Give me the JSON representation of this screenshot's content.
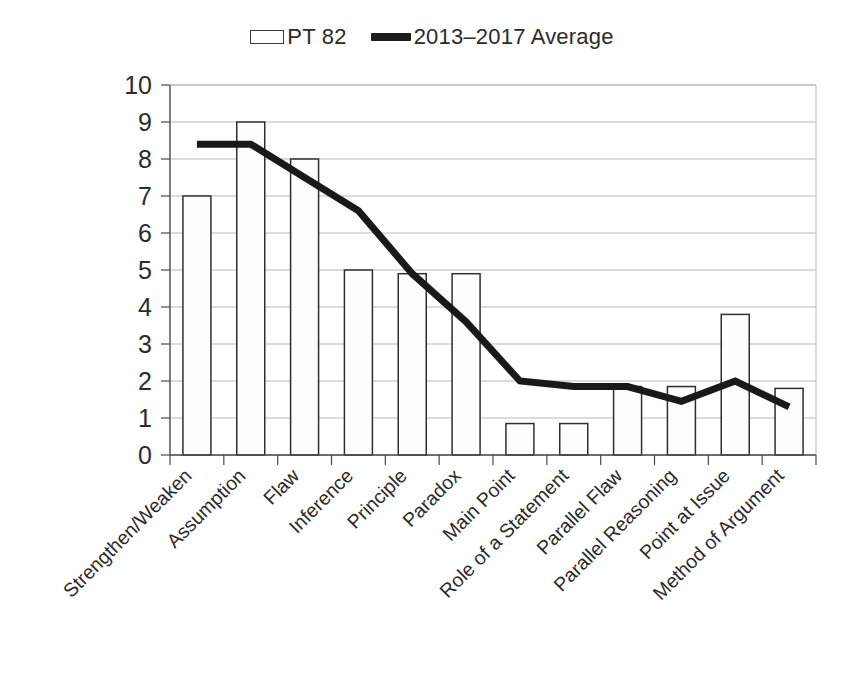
{
  "legend": {
    "position": "top-center",
    "entries": [
      {
        "label": "PT 82",
        "marker": "bar-swatch-icon",
        "type": "bar"
      },
      {
        "label": "2013–2017 Average",
        "marker": "line-swatch-icon",
        "type": "line"
      }
    ]
  },
  "colors": {
    "bar_fill": "#fdfdfd",
    "bar_stroke": "#2e2e2e",
    "line": "#191919",
    "gridline": "#b9b9b9",
    "axis": "#4a4a4a",
    "text": "#2b2b2b",
    "background": "#ffffff"
  },
  "chart_data": {
    "type": "bar",
    "title": "",
    "subtitle": "",
    "xlabel": "",
    "ylabel": "",
    "ylim": [
      0,
      10
    ],
    "yticks": [
      0,
      1,
      2,
      3,
      4,
      5,
      6,
      7,
      8,
      9,
      10
    ],
    "ytick_labels": [
      "0",
      "1",
      "2",
      "3",
      "4",
      "5",
      "6",
      "7",
      "8",
      "9",
      "10"
    ],
    "grid": true,
    "grid_axis": "y",
    "xtick_rotation": 45,
    "categories": [
      "Strengthen/Weaken",
      "Assumption",
      "Flaw",
      "Inference",
      "Principle",
      "Paradox",
      "Main Point",
      "Role of a Statement",
      "Parallel Flaw",
      "Parallel Reasoning",
      "Point at Issue",
      "Method of Argument"
    ],
    "series": [
      {
        "name": "PT 82",
        "type": "bar",
        "values": [
          7,
          9,
          8,
          5,
          4.9,
          4.9,
          0.85,
          0.85,
          1.85,
          1.85,
          3.8,
          1.8
        ]
      },
      {
        "name": "2013–2017 Average",
        "type": "line",
        "values": [
          8.4,
          8.4,
          7.5,
          6.6,
          4.9,
          3.6,
          2.0,
          1.85,
          1.85,
          1.45,
          2.0,
          1.3
        ]
      }
    ]
  }
}
